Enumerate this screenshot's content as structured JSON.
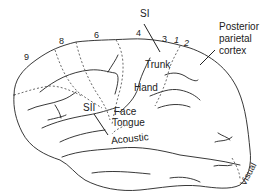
{
  "figure": {
    "labels": {
      "si": "SI",
      "sii": "SII",
      "posterior_parietal": [
        "Posterior",
        "parietal",
        "cortex"
      ],
      "trunk": "Trunk",
      "hand": "Hand",
      "face": "Face",
      "tongue": "Tongue",
      "acoustic": "Acoustic",
      "visual": "Visual"
    },
    "area_numbers": {
      "a9": "9",
      "a8": "8",
      "a6": "6",
      "a4": "4",
      "a3": "3",
      "a1": "1",
      "a2": "2"
    },
    "colors": {
      "line": "#222222",
      "background": "#ffffff"
    }
  }
}
